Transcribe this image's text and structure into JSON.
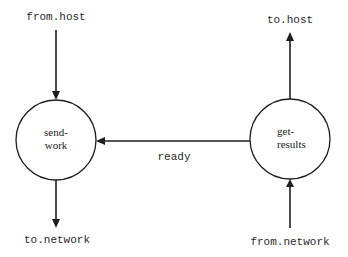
{
  "nodes": {
    "send_work": {
      "line1": "send-",
      "line2": "work"
    },
    "get_results": {
      "line1": "get-",
      "line2": "results"
    }
  },
  "edges": {
    "from_host": {
      "label": "from.host",
      "direction": "into send-work"
    },
    "to_network": {
      "label": "to.network",
      "direction": "out of send-work"
    },
    "to_host": {
      "label": "to.host",
      "direction": "out of get-results"
    },
    "from_network": {
      "label": "from.network",
      "direction": "into get-results"
    },
    "ready": {
      "label": "ready",
      "direction": "get-results to send-work"
    }
  },
  "colors": {
    "stroke": "#1e1e1e",
    "text": "#2a2a2a",
    "background": "#ffffff"
  }
}
